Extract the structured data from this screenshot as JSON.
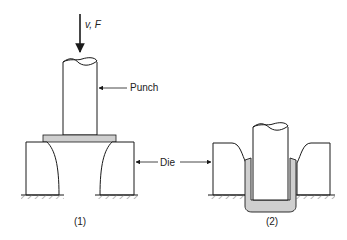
{
  "labels": {
    "force": "v, F",
    "punch": "Punch",
    "die": "Die",
    "stage1": "(1)",
    "stage2": "(2)"
  },
  "colors": {
    "line": "#1a1a1a",
    "sheet": "#cfcfcf",
    "background": "#ffffff"
  }
}
